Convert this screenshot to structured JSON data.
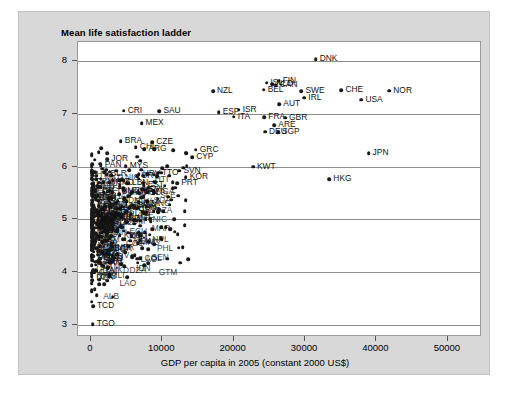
{
  "chart_data": {
    "type": "scatter",
    "title": "Mean life satisfaction ladder",
    "xlabel": "GDP per capita in 2005 (constant 2000 US$)",
    "ylabel": "",
    "xlim": [
      -1800,
      54500
    ],
    "ylim": [
      2.82,
      8.35
    ],
    "xticks": [
      0,
      10000,
      20000,
      30000,
      40000,
      50000
    ],
    "xtick_labels": [
      "0",
      "10000",
      "20000",
      "30000",
      "40000",
      "50000"
    ],
    "yticks": [
      3,
      4,
      5,
      6,
      7,
      8
    ],
    "ytick_labels": [
      "3",
      "4",
      "5",
      "6",
      "7",
      "8"
    ],
    "grid": "horizontal",
    "legend": "none",
    "marker_color": "#1a1a1a",
    "panel_color": "#ffffff",
    "figure_color": "#d8d8d8",
    "points": [
      {
        "label": "DNK",
        "x": 31500,
        "y": 8.02
      },
      {
        "label": "FIN",
        "x": 26300,
        "y": 7.62
      },
      {
        "label": "ISL",
        "x": 24600,
        "y": 7.58
      },
      {
        "label": "NLD",
        "x": 25400,
        "y": 7.55
      },
      {
        "label": "CAN",
        "x": 25900,
        "y": 7.54
      },
      {
        "label": "BEL",
        "x": 24200,
        "y": 7.45
      },
      {
        "label": "SWE",
        "x": 29500,
        "y": 7.42
      },
      {
        "label": "CHE",
        "x": 35100,
        "y": 7.44
      },
      {
        "label": "NOR",
        "x": 41800,
        "y": 7.43
      },
      {
        "label": "IRL",
        "x": 29900,
        "y": 7.3
      },
      {
        "label": "USA",
        "x": 37900,
        "y": 7.26
      },
      {
        "label": "NZL",
        "x": 17100,
        "y": 7.42
      },
      {
        "label": "AUT",
        "x": 26400,
        "y": 7.18
      },
      {
        "label": "ISR",
        "x": 20700,
        "y": 7.07
      },
      {
        "label": "ESP",
        "x": 17900,
        "y": 7.03
      },
      {
        "label": "CRI",
        "x": 4600,
        "y": 7.05
      },
      {
        "label": "SAU",
        "x": 9600,
        "y": 7.04
      },
      {
        "label": "ITA",
        "x": 20000,
        "y": 6.94
      },
      {
        "label": "FRA",
        "x": 24300,
        "y": 6.93
      },
      {
        "label": "GBR",
        "x": 27200,
        "y": 6.92
      },
      {
        "label": "MEX",
        "x": 7100,
        "y": 6.82
      },
      {
        "label": "ARE",
        "x": 25700,
        "y": 6.78
      },
      {
        "label": "DEU",
        "x": 24400,
        "y": 6.66
      },
      {
        "label": "SGP",
        "x": 26200,
        "y": 6.65
      },
      {
        "label": "BRA",
        "x": 4200,
        "y": 6.48
      },
      {
        "label": "CZE",
        "x": 8600,
        "y": 6.46
      },
      {
        "label": "CHL",
        "x": 6300,
        "y": 6.36
      },
      {
        "label": "ARG",
        "x": 7500,
        "y": 6.33
      },
      {
        "label": "GRC",
        "x": 14700,
        "y": 6.32
      },
      {
        "label": "JPN",
        "x": 38900,
        "y": 6.25
      },
      {
        "label": "CYP",
        "x": 14200,
        "y": 6.18
      },
      {
        "label": "JOR",
        "x": 2300,
        "y": 6.14
      },
      {
        "label": "PAN",
        "x": 1400,
        "y": 6.02
      },
      {
        "label": "MYS",
        "x": 4900,
        "y": 6.01
      },
      {
        "label": "KWT",
        "x": 22700,
        "y": 6.0
      },
      {
        "label": "SVN",
        "x": 12400,
        "y": 5.92
      },
      {
        "label": "TTO",
        "x": 9400,
        "y": 5.88
      },
      {
        "label": "BLR",
        "x": 2200,
        "y": 5.85
      },
      {
        "label": "HRV",
        "x": 6700,
        "y": 5.85
      },
      {
        "label": "URY",
        "x": 6500,
        "y": 5.82
      },
      {
        "label": "KOR",
        "x": 13300,
        "y": 5.8
      },
      {
        "label": "HKG",
        "x": 33400,
        "y": 5.76
      },
      {
        "label": "KAZ",
        "x": 2600,
        "y": 5.7
      },
      {
        "label": "LBN",
        "x": 5200,
        "y": 5.68
      },
      {
        "label": "EST",
        "x": 7400,
        "y": 5.65
      },
      {
        "label": "PRT",
        "x": 12100,
        "y": 5.69
      },
      {
        "label": "SVK",
        "x": 7600,
        "y": 5.56
      },
      {
        "label": "TUN",
        "x": 3000,
        "y": 5.52
      },
      {
        "label": "POL",
        "x": 6800,
        "y": 5.5
      },
      {
        "label": "LVA",
        "x": 5800,
        "y": 5.27
      },
      {
        "label": "HUN",
        "x": 6100,
        "y": 5.22
      },
      {
        "label": "RUS",
        "x": 3100,
        "y": 5.14
      },
      {
        "label": "LTU",
        "x": 5600,
        "y": 5.1
      },
      {
        "label": "ROU",
        "x": 2900,
        "y": 5.05
      },
      {
        "label": "IRN",
        "x": 2200,
        "y": 4.85
      },
      {
        "label": "BGR",
        "x": 2700,
        "y": 4.44
      },
      {
        "label": "GEO",
        "x": 1300,
        "y": 4.26
      },
      {
        "label": "ARM",
        "x": 1300,
        "y": 4.18
      },
      {
        "label": "TCD",
        "x": 300,
        "y": 3.36
      },
      {
        "label": "TGO",
        "x": 260,
        "y": 3.02
      }
    ]
  },
  "labels_visible": [
    "DNK",
    "FIN",
    "ISL",
    "NLD",
    "CAN",
    "BEL",
    "SWE",
    "CHE",
    "NOR",
    "IRL",
    "USA",
    "NZL",
    "AUT",
    "ISR",
    "ESP",
    "CRI",
    "SAU",
    "ITA",
    "FRA",
    "GBR",
    "MEX",
    "ARE",
    "DEU",
    "SGP",
    "BRA",
    "CZE",
    "CHL",
    "ARG",
    "GRC",
    "JPN",
    "CYP",
    "JOR",
    "PAN",
    "MYS",
    "KWT",
    "SVN",
    "TTO",
    "BLR",
    "HRV",
    "URY",
    "KOR",
    "HKG",
    "KAZ",
    "LBN",
    "EST",
    "PRT",
    "SVK",
    "TUN",
    "POL",
    "LVA",
    "HUN",
    "RUS",
    "LTU",
    "ROU",
    "IRN",
    "BGR",
    "GEO",
    "ARM",
    "TCD",
    "TGO"
  ]
}
